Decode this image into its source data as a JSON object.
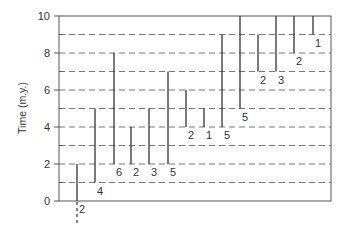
{
  "chart_data": {
    "type": "range-bar",
    "title": "",
    "xlabel": "",
    "ylabel": "Time (m.y.)",
    "ylim": [
      0,
      10
    ],
    "yticks": [
      0,
      2,
      4,
      6,
      8,
      10
    ],
    "yminor_ticks": [
      1,
      3,
      5,
      7,
      9
    ],
    "grid": {
      "horizontal_dashed_at": [
        1,
        2,
        3,
        4,
        5,
        6,
        7,
        8,
        9
      ],
      "style": "dashed"
    },
    "frame": "box",
    "legend": null,
    "series": [
      {
        "index": 1,
        "start": 0,
        "end": 2,
        "label": "2",
        "extends_below_zero": true
      },
      {
        "index": 2,
        "start": 1,
        "end": 5,
        "label": "4"
      },
      {
        "index": 3,
        "start": 2,
        "end": 8,
        "label": "6"
      },
      {
        "index": 4,
        "start": 2,
        "end": 4,
        "label": "2"
      },
      {
        "index": 5,
        "start": 2,
        "end": 5,
        "label": "3"
      },
      {
        "index": 6,
        "start": 2,
        "end": 7,
        "label": "5"
      },
      {
        "index": 7,
        "start": 4,
        "end": 6,
        "label": "2"
      },
      {
        "index": 8,
        "start": 4,
        "end": 5,
        "label": "1"
      },
      {
        "index": 9,
        "start": 4,
        "end": 9,
        "label": "5"
      },
      {
        "index": 10,
        "start": 5,
        "end": 10,
        "label": "5"
      },
      {
        "index": 11,
        "start": 7,
        "end": 9,
        "label": "2"
      },
      {
        "index": 12,
        "start": 7,
        "end": 10,
        "label": "3"
      },
      {
        "index": 13,
        "start": 8,
        "end": 10,
        "label": "2"
      },
      {
        "index": 14,
        "start": 9,
        "end": 10,
        "label": "1"
      }
    ],
    "colors": {
      "bars": "#333333",
      "grid": "#777777",
      "frame": "#555555",
      "text": "#333333"
    }
  }
}
